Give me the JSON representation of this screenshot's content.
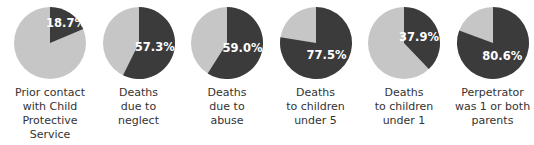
{
  "colors": {
    "highlight": "#3b3b3b",
    "remainder": "#c6c6c6",
    "text": "#333333"
  },
  "chart_data": {
    "type": "pie",
    "title": "",
    "charts": [
      {
        "label": "Prior contact with Child Protective Service",
        "value": 18.7,
        "display": "18.7%"
      },
      {
        "label": "Deaths due to neglect",
        "value": 57.3,
        "display": "57.3%"
      },
      {
        "label": "Deaths due to abuse",
        "value": 59.0,
        "display": "59.0%"
      },
      {
        "label": "Deaths to children under 5",
        "value": 77.5,
        "display": "77.5%"
      },
      {
        "label": "Deaths to children under 1",
        "value": 37.9,
        "display": "37.9%"
      },
      {
        "label": "Perpetrator was 1 or both parents",
        "value": 80.6,
        "display": "80.6%"
      }
    ]
  },
  "labels": [
    [
      "Prior contact",
      "with Child",
      "Protective",
      "Service"
    ],
    [
      "Deaths",
      "due to",
      "neglect"
    ],
    [
      "Deaths",
      "due to",
      "abuse"
    ],
    [
      "Deaths",
      "to children",
      "under 5"
    ],
    [
      "Deaths",
      "to children",
      "under 1"
    ],
    [
      "Perpetrator",
      "was 1 or both",
      "parents"
    ]
  ]
}
